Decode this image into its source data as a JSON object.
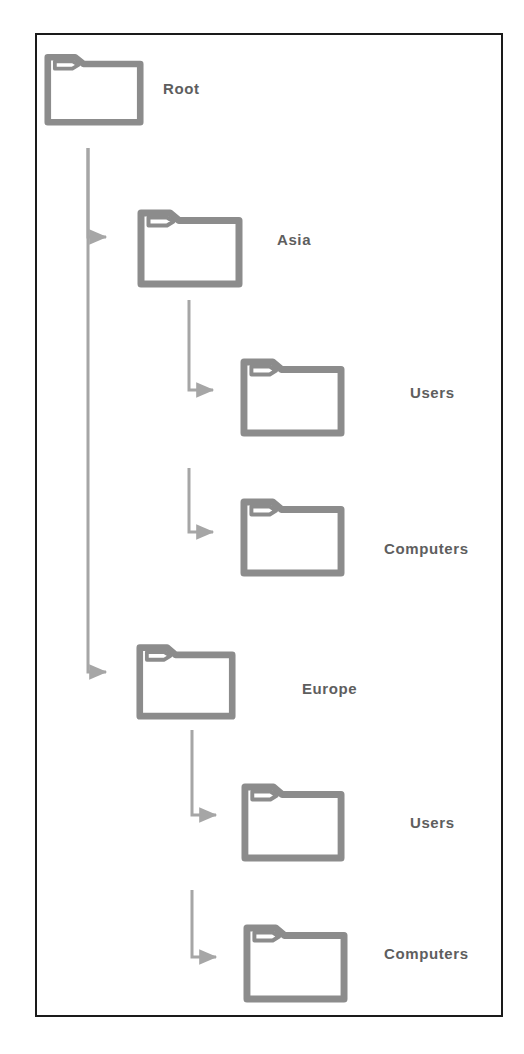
{
  "diagram": {
    "type": "tree",
    "colors": {
      "frame_border": "#1a1a1a",
      "folder_stroke": "#8c8c8c",
      "folder_fill": "#ffffff",
      "arrow": "#a6a6a6",
      "label_text": "#5e5e5e",
      "background": "#ffffff"
    },
    "nodes": [
      {
        "id": "root",
        "label": "Root",
        "level": 0,
        "icon": "folder-icon",
        "folder": {
          "x": 44,
          "y": 48,
          "w": 100,
          "h": 78
        },
        "label_pos": {
          "x": 163,
          "y": 80
        }
      },
      {
        "id": "asia",
        "label": "Asia",
        "level": 1,
        "icon": "folder-icon",
        "folder": {
          "x": 137,
          "y": 203,
          "w": 106,
          "h": 85
        },
        "label_pos": {
          "x": 277,
          "y": 231
        }
      },
      {
        "id": "asia-users",
        "label": "Users",
        "level": 2,
        "icon": "folder-icon",
        "folder": {
          "x": 240,
          "y": 352,
          "w": 105,
          "h": 85
        },
        "label_pos": {
          "x": 410,
          "y": 384
        }
      },
      {
        "id": "asia-computers",
        "label": "Computers",
        "level": 2,
        "icon": "folder-icon",
        "folder": {
          "x": 240,
          "y": 492,
          "w": 105,
          "h": 85
        },
        "label_pos": {
          "x": 384,
          "y": 540
        }
      },
      {
        "id": "europe",
        "label": "Europe",
        "level": 1,
        "icon": "folder-icon",
        "folder": {
          "x": 136,
          "y": 638,
          "w": 100,
          "h": 82
        },
        "label_pos": {
          "x": 302,
          "y": 680
        }
      },
      {
        "id": "europe-users",
        "label": "Users",
        "level": 2,
        "icon": "folder-icon",
        "folder": {
          "x": 241,
          "y": 777,
          "w": 104,
          "h": 85
        },
        "label_pos": {
          "x": 410,
          "y": 814
        }
      },
      {
        "id": "europe-computers",
        "label": "Computers",
        "level": 2,
        "icon": "folder-icon",
        "folder": {
          "x": 243,
          "y": 918,
          "w": 105,
          "h": 85
        },
        "label_pos": {
          "x": 384,
          "y": 945
        }
      }
    ],
    "connectors": [
      {
        "id": "root-to-asia",
        "from": "root",
        "to": "asia",
        "path": "M 88 148 L 88 237 L 106 237"
      },
      {
        "id": "root-to-europe",
        "from": "root",
        "to": "europe",
        "path": "M 88 148 L 88 672 L 106 672"
      },
      {
        "id": "asia-to-users",
        "from": "asia",
        "to": "asia-users",
        "path": "M 189 300 L 189 390 L 213 390"
      },
      {
        "id": "asia-to-computers",
        "from": "asia",
        "to": "asia-computers",
        "path": "M 189 468 L 189 532 L 213 532"
      },
      {
        "id": "europe-to-users",
        "from": "europe",
        "to": "europe-users",
        "path": "M 192 730 L 192 815 L 216 815"
      },
      {
        "id": "europe-to-computers",
        "from": "europe",
        "to": "europe-computers",
        "path": "M 192 890 L 192 957 L 216 957"
      }
    ]
  }
}
